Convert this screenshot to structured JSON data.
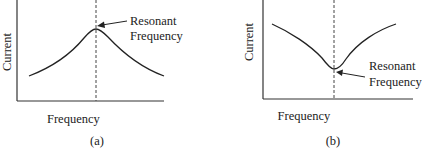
{
  "figure": {
    "panels": [
      {
        "id": "a",
        "panel_label": "(a)",
        "ylabel": "Current",
        "xlabel": "Frequency",
        "annotation_line1": "Resonant",
        "annotation_line2": "Frequency",
        "curve_shape": "peak"
      },
      {
        "id": "b",
        "panel_label": "(b)",
        "ylabel": "Current",
        "xlabel": "Frequency",
        "annotation_line1": "Resonant",
        "annotation_line2": "Frequency",
        "curve_shape": "dip"
      }
    ],
    "colors": {
      "line": "#222222",
      "background": "#ffffff"
    }
  }
}
